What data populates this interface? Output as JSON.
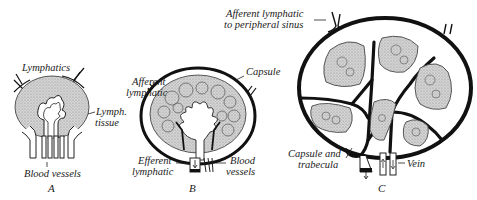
{
  "figure": {
    "colors": {
      "ink": "#111111",
      "tissue_fill": "#c9c9c9",
      "sinus_fill": "#ffffff",
      "background": "#ffffff"
    },
    "panels": [
      {
        "letter": "A",
        "labels": {
          "lymphatics": "Lymphatics",
          "lymph_tissue_line1": "Lymph.",
          "lymph_tissue_line2": "tissue",
          "blood_vessels": "Blood vessels"
        }
      },
      {
        "letter": "B",
        "labels": {
          "afferent_line1": "Afferent",
          "afferent_line2": "lymphatic",
          "capsule": "Capsule",
          "efferent_line1": "Efferent",
          "efferent_line2": "lymphatic",
          "blood_line1": "Blood",
          "blood_line2": "vessels"
        }
      },
      {
        "letter": "C",
        "labels": {
          "afferent_line1": "Afferent lymphatic",
          "afferent_line2": "to peripheral sinus",
          "capsule_line1": "Capsule and",
          "capsule_line2": "trabecula",
          "vein": "Vein"
        }
      }
    ]
  }
}
